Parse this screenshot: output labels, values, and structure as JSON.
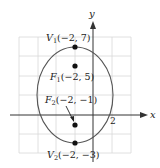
{
  "figure": {
    "type": "ellipse-graph",
    "axes": {
      "x_label": "x",
      "y_label": "y",
      "tick_label_x": "2"
    },
    "ellipse": {
      "center": [
        -2,
        2
      ],
      "semi_major_vertical": 5,
      "semi_minor": 4
    },
    "points": [
      {
        "id": "V1",
        "name": "V",
        "sub": "1",
        "coords": "(−2, 7)",
        "x": -2,
        "y": 7
      },
      {
        "id": "F1",
        "name": "F",
        "sub": "1",
        "coords": "(−2, 5)",
        "x": -2,
        "y": 5
      },
      {
        "id": "F2",
        "name": "F",
        "sub": "2",
        "coords": "(−2, −1)",
        "x": -2,
        "y": -1
      },
      {
        "id": "V2",
        "name": "V",
        "sub": "2",
        "coords": "(−2, −3)",
        "x": -2,
        "y": -3
      }
    ],
    "colors": {
      "grid": "#d8d8d8",
      "axis": "#333333",
      "curve": "#555555",
      "point": "#111111"
    }
  }
}
